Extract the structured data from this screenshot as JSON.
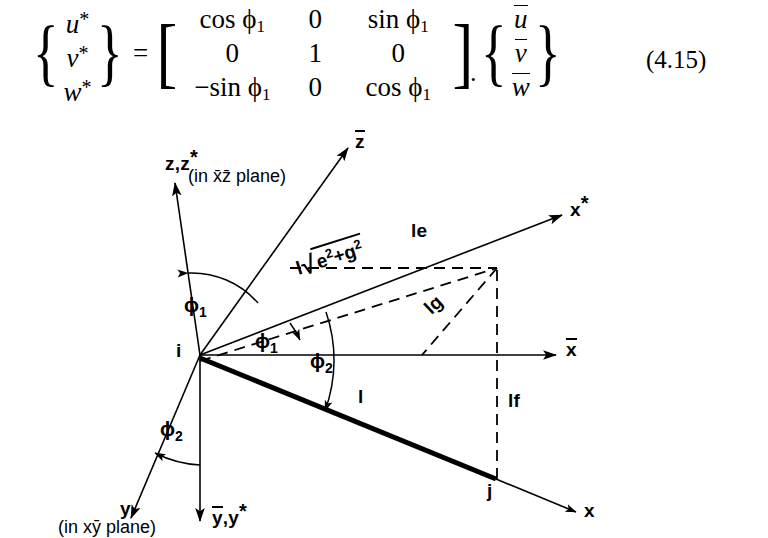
{
  "equation": {
    "number": "(4.15)",
    "period": ".",
    "lhs": [
      {
        "base": "u",
        "star": "*"
      },
      {
        "base": "v",
        "star": "*"
      },
      {
        "base": "w",
        "star": "*"
      }
    ],
    "matrix": [
      [
        "cos ϕ",
        "0",
        "sin ϕ"
      ],
      [
        "0",
        "1",
        "0"
      ],
      [
        "−sin ϕ",
        "0",
        "cos ϕ"
      ]
    ],
    "matrix_rows": [
      {
        "c0": "cos ϕ",
        "c0sub": "1",
        "c1": "0",
        "c1sub": "",
        "c2": "sin ϕ",
        "c2sub": "1"
      },
      {
        "c0": "0",
        "c0sub": "",
        "c1": "1",
        "c1sub": "",
        "c2": "0",
        "c2sub": ""
      },
      {
        "c0": "−sin ϕ",
        "c0sub": "1",
        "c1": "0",
        "c1sub": "",
        "c2": "cos ϕ",
        "c2sub": "1"
      }
    ],
    "rhs": [
      {
        "base": "u",
        "bar": true
      },
      {
        "base": "v",
        "bar": true
      },
      {
        "base": "w",
        "bar": true
      }
    ],
    "equals": "="
  },
  "diagram": {
    "axes": [
      {
        "name": "z-zstar-axis",
        "label_main": "z,z",
        "label_star": "*",
        "note": "(in x̄z̄ plane)"
      },
      {
        "name": "zbar-axis",
        "label": "z",
        "bar": true
      },
      {
        "name": "xstar-axis",
        "label": "x",
        "star": "*"
      },
      {
        "name": "xbar-axis",
        "label": "x",
        "bar": true
      },
      {
        "name": "x-axis",
        "label": "x"
      },
      {
        "name": "y-axis",
        "label": "y",
        "note": "(in xȳ plane)"
      },
      {
        "name": "ybar-ystar-axis",
        "label_main": "y,y",
        "label_star": "*",
        "bar_on_first": true
      }
    ],
    "labels": {
      "origin": "i",
      "endpoint": "j",
      "length_l": "l",
      "le": "le",
      "lg": "lg",
      "lf": "lf",
      "radical_prefix": "l",
      "radical_e": "e",
      "radical_e_exp": "2",
      "radical_plus": "+",
      "radical_g": "g",
      "radical_g_exp": "2",
      "phi1_top": "ϕ",
      "phi1_top_sub": "1",
      "phi1_mid": "ϕ",
      "phi1_mid_sub": "1",
      "phi2_right": "ϕ",
      "phi2_right_sub": "2",
      "phi2_bottom": "ϕ",
      "phi2_bottom_sub": "2"
    },
    "colors": {
      "line": "#000000",
      "background": "#ffffff"
    }
  }
}
